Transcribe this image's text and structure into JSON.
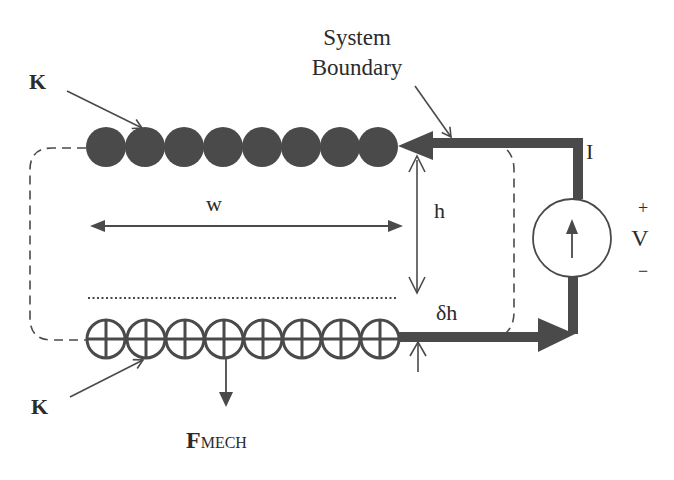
{
  "labels": {
    "system_boundary_line1": "System",
    "system_boundary_line2": "Boundary",
    "k_top": "K",
    "k_bottom": "K",
    "width": "w",
    "height": "h",
    "delta_h": "δh",
    "current": "I",
    "voltage": "V",
    "plus": "+",
    "minus": "−",
    "force_main": "F",
    "force_sub": "MECH"
  },
  "elements": {
    "top_conductor": {
      "count": 8,
      "style": "filled-circle",
      "meaning": "current out of page"
    },
    "bottom_conductor": {
      "count": 8,
      "style": "crossed-circle",
      "meaning": "current into page"
    },
    "current_source": {
      "symbol": "circle-with-up-arrow"
    }
  },
  "colors": {
    "ink": "#4a4a4a",
    "text": "#2b2b2b",
    "background": "#ffffff"
  }
}
